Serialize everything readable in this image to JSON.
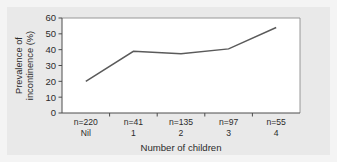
{
  "figure": {
    "background_color": "#e9e9e9",
    "plot_background_color": "#ffffff",
    "line_color": "#5a5a5a",
    "axis_color": "#4c4c4c"
  },
  "axis": {
    "ylabel_line1": "Prevalence of",
    "ylabel_line2": "incontinence (%)",
    "xlabel": "Number of children",
    "yticks": [
      "0",
      "10",
      "20",
      "30",
      "40",
      "50",
      "60"
    ]
  },
  "chart_data": {
    "type": "line",
    "title": "",
    "xlabel": "Number of children",
    "ylabel": "Prevalence of incontinence (%)",
    "categories": [
      "Nil",
      "1",
      "2",
      "3",
      "4"
    ],
    "group_sizes": [
      "n=220",
      "n=41",
      "n=135",
      "n=97",
      "n=55"
    ],
    "values": [
      20,
      39,
      37.5,
      40.5,
      54
    ],
    "ylim": [
      0,
      60
    ],
    "ytick_values": [
      0,
      10,
      20,
      30,
      40,
      50,
      60
    ],
    "grid": false,
    "legend": null,
    "series": [
      {
        "name": "Prevalence of incontinence (%)",
        "values": [
          20,
          39,
          37.5,
          40.5,
          54
        ]
      }
    ]
  }
}
